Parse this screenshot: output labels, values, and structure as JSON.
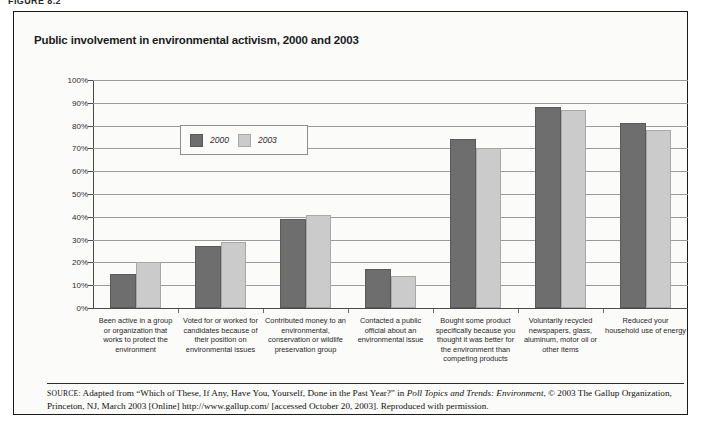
{
  "figure_label": "FIGURE 8.2",
  "chart_data": {
    "type": "bar",
    "title": "Public involvement in environmental activism, 2000 and 2003",
    "xlabel": "",
    "ylabel": "",
    "ylim": [
      0,
      100
    ],
    "grid": true,
    "legend_position": "inside-upper-left",
    "ytick_labels": [
      "100%",
      "90%",
      "80%",
      "70%",
      "60%",
      "50%",
      "40%",
      "30%",
      "20%",
      "10%",
      "0%"
    ],
    "ytick_values": [
      100,
      90,
      80,
      70,
      60,
      50,
      40,
      30,
      20,
      10,
      0
    ],
    "categories": [
      "Been active in a group or organization that works to protect the environment",
      "Voted for or worked for candidates because of their position on environmental issues",
      "Contributed money to an environmental, conservation or wildlife preservation group",
      "Contacted a public official about an environmental issue",
      "Bought some product specifically because you thought it was better for the environment than competing products",
      "Voluntarily recycled newspapers, glass, aluminum, motor oil or other items",
      "Reduced your household use of energy"
    ],
    "series": [
      {
        "name": "2000",
        "color": "#6e6e6e",
        "values": [
          15,
          27,
          39,
          17,
          74,
          88,
          81
        ]
      },
      {
        "name": "2003",
        "color": "#cbcbcb",
        "values": [
          20,
          29,
          41,
          14,
          70,
          87,
          78
        ]
      }
    ]
  },
  "source": {
    "prefix": "SOURCE:",
    "part1": " Adapted from “Which of These, If Any, Have You, Yourself, Done in the Past Year?” in ",
    "italic": "Poll Topics and Trends: Environment",
    "part2": ", © 2003 The Gallup Organization, Princeton, NJ, March 2003 [Online] http://www.gallup.com/ [accessed October 20, 2003]. Reproduced with permission."
  }
}
